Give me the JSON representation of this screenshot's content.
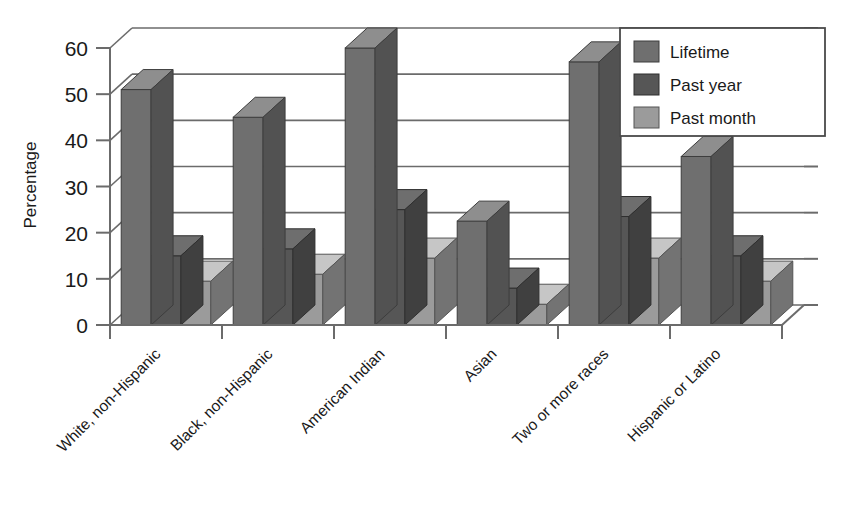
{
  "chart_data": {
    "type": "bar",
    "title": "",
    "xlabel": "",
    "ylabel": "Percentage",
    "ylim": [
      0,
      60
    ],
    "yticks": [
      0,
      10,
      20,
      30,
      40,
      50,
      60
    ],
    "ytick_labels": [
      "0",
      "10",
      "20",
      "30",
      "40",
      "50",
      "60"
    ],
    "grid": true,
    "legend_position": "top-right",
    "style": "3d-grouped-bar",
    "categories": [
      "White, non-Hispanic",
      "Black, non-Hispanic",
      "American Indian",
      "Asian",
      "Two or more races",
      "Hispanic or Latino"
    ],
    "series": [
      {
        "name": "Lifetime",
        "color": "#6f6f6f",
        "values": [
          51,
          45,
          60,
          22.5,
          57,
          36.5
        ]
      },
      {
        "name": "Past year",
        "color": "#565656",
        "values": [
          15,
          16.5,
          25,
          8,
          23.5,
          15
        ]
      },
      {
        "name": "Past month",
        "color": "#9b9b9b",
        "values": [
          9.5,
          11,
          14.5,
          4.5,
          14.5,
          9.5
        ]
      }
    ]
  },
  "legend": {
    "items": [
      {
        "label": "Lifetime",
        "color": "#6f6f6f"
      },
      {
        "label": "Past year",
        "color": "#565656"
      },
      {
        "label": "Past month",
        "color": "#9b9b9b"
      }
    ]
  },
  "axes": {
    "y_title": "Percentage"
  },
  "colors": {
    "axis_line": "#6b6b6b",
    "grid_line": "#6b6b6b",
    "background": "#ffffff",
    "text": "#1a1a1a",
    "bar_top_tint": "#8d8d8d",
    "bar_side_tint": "#4a4a4a"
  }
}
